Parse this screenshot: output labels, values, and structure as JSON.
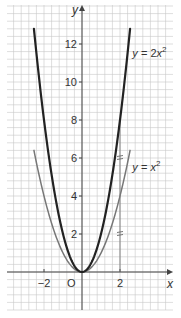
{
  "chart_data": {
    "type": "line",
    "title": "",
    "xlabel": "x",
    "ylabel": "y",
    "xlim": [
      -3.94,
      4.79
    ],
    "ylim": [
      -2.0,
      14.05
    ],
    "grid": true,
    "grid_spacing": 0.4,
    "x_ticks": [
      {
        "value": -2,
        "label": "−2"
      },
      {
        "value": 2,
        "label": "2"
      }
    ],
    "y_ticks": [
      {
        "value": 2,
        "label": "2"
      },
      {
        "value": 4,
        "label": "4"
      },
      {
        "value": 6,
        "label": "6"
      },
      {
        "value": 8,
        "label": "8"
      },
      {
        "value": 10,
        "label": "10"
      },
      {
        "value": 12,
        "label": "12"
      }
    ],
    "origin_label": "O",
    "series": [
      {
        "name": "y = 2x²",
        "formula": "2*x^2",
        "x_range": [
          -2.53,
          2.53
        ],
        "color": "#222222",
        "width": 2.2,
        "points": [
          [
            -2.5,
            12.5
          ],
          [
            -2,
            8
          ],
          [
            -1.5,
            4.5
          ],
          [
            -1,
            2
          ],
          [
            -0.5,
            0.5
          ],
          [
            0,
            0
          ],
          [
            0.5,
            0.5
          ],
          [
            1,
            2
          ],
          [
            1.5,
            4.5
          ],
          [
            2,
            8
          ],
          [
            2.5,
            12.5
          ]
        ],
        "label": {
          "text_main": "y = 2x",
          "sup": "2",
          "x": 2.65,
          "y": 11.3
        }
      },
      {
        "name": "y = x²",
        "formula": "x^2",
        "x_range": [
          -2.53,
          2.53
        ],
        "color": "#777777",
        "width": 1.5,
        "points": [
          [
            -2.5,
            6.25
          ],
          [
            -2,
            4
          ],
          [
            -1.5,
            2.25
          ],
          [
            -1,
            1
          ],
          [
            -0.5,
            0.25
          ],
          [
            0,
            0
          ],
          [
            0.5,
            0.25
          ],
          [
            1,
            1
          ],
          [
            1.5,
            2.25
          ],
          [
            2,
            4
          ],
          [
            2.5,
            6.25
          ]
        ],
        "label": {
          "text_main": "y = x",
          "sup": "2",
          "x": 2.65,
          "y": 5.3
        }
      }
    ],
    "annotations": [
      {
        "type": "vertical-guide",
        "x": 2,
        "from_y": 0,
        "to_y": 8,
        "note": "line from x=2 up to curves"
      },
      {
        "type": "equal-mark",
        "x": 2,
        "y": 2,
        "note": "double tick"
      },
      {
        "type": "equal-mark",
        "x": 2,
        "y": 6,
        "note": "double tick"
      }
    ]
  },
  "mapping": {
    "origin_px": [
      82,
      272
    ],
    "px_per_unit": 19,
    "grid_left": 7,
    "grid_right": 173,
    "grid_top": 5,
    "grid_bottom": 310
  },
  "colors": {
    "grid": "#c8c8c8",
    "axis": "#444444",
    "text": "#333333"
  }
}
